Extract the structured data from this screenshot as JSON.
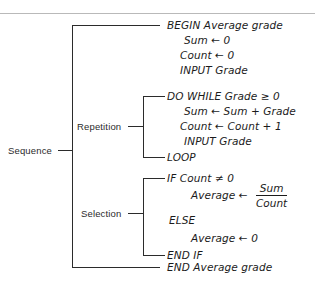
{
  "diagram": {
    "title_rule": true,
    "structure_labels": [
      {
        "id": "sequence",
        "label": "Sequence"
      },
      {
        "id": "repetition",
        "label": "Repetition"
      },
      {
        "id": "selection",
        "label": "Selection"
      }
    ],
    "pseudocode": {
      "begin": "BEGIN   Average grade",
      "sum_init": "Sum  ←  0",
      "count_init": "Count ← 0",
      "input_grade_1": "INPUT Grade",
      "do_while": "DO WHILE Grade ≥ 0",
      "sum_accum": "Sum  ←   Sum + Grade",
      "count_accum": "Count ←  Count + 1",
      "input_grade_2": "INPUT Grade",
      "loop": "LOOP",
      "if_count": "IF Count ≠ 0",
      "average_assign": "Average ←",
      "fraction_num": "Sum",
      "fraction_den": "Count",
      "else": "ELSE",
      "average_zero": "Average ←   0",
      "end_if": "END IF",
      "end": "END Average grade"
    },
    "colors": {
      "ink": "#1b1b1b",
      "rule": "#b9b9b9",
      "bracket": "#2b2b2b",
      "background": "#ffffff"
    }
  }
}
